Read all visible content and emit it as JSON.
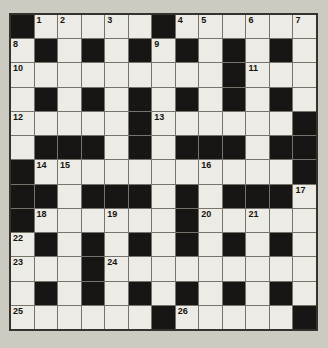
{
  "puzzle": {
    "type": "crossword",
    "rows": 13,
    "cols": 13,
    "colors": {
      "page_bg": "#cdcac2",
      "cell_bg": "#edebe6",
      "black_cell": "#171614",
      "grid_line": "#76736b",
      "outer_border": "#34322d",
      "number_color": "#14140f"
    },
    "pattern": [
      "#.....#......",
      ".#.#.#.#.#.#.",
      ".........#...",
      ".#.#.#.#.#.#.",
      ".....#......#",
      ".###.#.###.##",
      "#...........#",
      "##.###.#.###.",
      "#......#.....",
      ".#.#.#.#.#.#.",
      "...#.........",
      ".#.#.#.#.#.#.",
      "......#.....#"
    ],
    "numbers": {
      "1,2": "1",
      "1,3": "2",
      "1,5": "3",
      "1,8": "4",
      "1,9": "5",
      "1,11": "6",
      "1,13": "7",
      "2,1": "8",
      "2,7": "9",
      "3,1": "10",
      "3,11": "11",
      "5,1": "12",
      "5,7": "13",
      "7,2": "14",
      "7,3": "15",
      "7,9": "16",
      "8,13": "17",
      "9,2": "18",
      "9,5": "19",
      "9,9": "20",
      "9,11": "21",
      "10,1": "22",
      "11,1": "23",
      "11,5": "24",
      "13,1": "25",
      "13,8": "26"
    }
  }
}
